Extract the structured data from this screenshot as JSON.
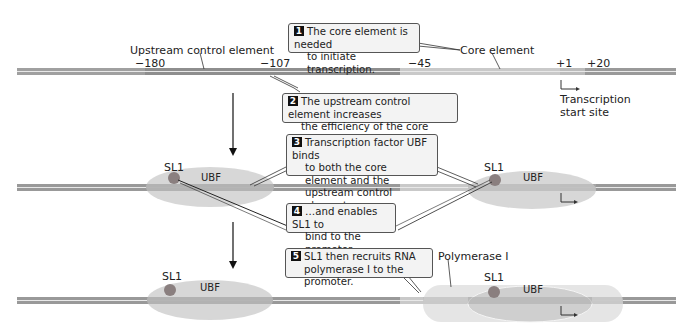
{
  "colors": {
    "dna_dark": "#8e8e8e",
    "dna_light": "#c7c7c7",
    "ubf_fill": "#d6d6d6",
    "polymerase_fill": "#e6e6e6",
    "sl1_fill": "#8a8a8a",
    "callout_fill": "#f3f3f3"
  },
  "row1": {
    "upstream_label": "Upstream control element",
    "core_label": "Core element",
    "positions": [
      "−180",
      "−107",
      "−45",
      "+1",
      "+20"
    ],
    "tss_label_line1": "Transcription",
    "tss_label_line2": "start site"
  },
  "callouts": [
    {
      "n": "1",
      "text": "The core element is needed to initiate transcription."
    },
    {
      "n": "2",
      "text": "The upstream control element increases the efficiency of the core element."
    },
    {
      "n": "3",
      "text": "Transcription factor UBF binds to both the core element and the upstream control element…"
    },
    {
      "n": "4",
      "text": "…and enables SL1 to bind to the promoter."
    },
    {
      "n": "5",
      "text": "SL1 then recruits RNA polymerase I to the promoter."
    }
  ],
  "callout_lines": {
    "c1": [
      "The core element is needed",
      "to initiate transcription."
    ],
    "c2": [
      "The upstream control element increases",
      "the efficiency of the core element."
    ],
    "c3": [
      "Transcription factor UBF binds",
      "to both the core element and the",
      "upstream control element…"
    ],
    "c4": [
      "…and enables SL1 to",
      "bind to the promoter."
    ],
    "c5": [
      "SL1 then recruits RNA",
      "polymerase I to the promoter."
    ]
  },
  "row2": {
    "left": {
      "sl1": "SL1",
      "ubf": "UBF"
    },
    "right": {
      "sl1": "SL1",
      "ubf": "UBF"
    }
  },
  "row3": {
    "left": {
      "sl1": "SL1",
      "ubf": "UBF"
    },
    "right": {
      "sl1": "SL1",
      "ubf": "UBF",
      "polymerase": "Polymerase I"
    }
  }
}
